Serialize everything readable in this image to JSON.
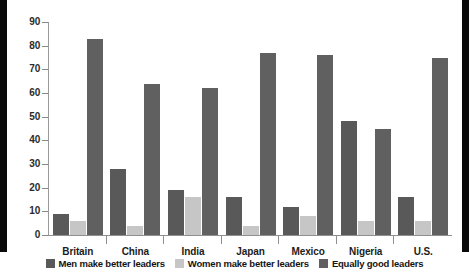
{
  "chart_data": {
    "type": "bar",
    "title": "",
    "subtitle": "",
    "xlabel": "",
    "ylabel": "",
    "ylim": [
      0,
      90
    ],
    "yticks": [
      0,
      10,
      20,
      30,
      40,
      50,
      60,
      70,
      80,
      90
    ],
    "grid": false,
    "legend_position": "bottom",
    "categories": [
      "Britain",
      "China",
      "India",
      "Japan",
      "Mexico",
      "Nigeria",
      "U.S."
    ],
    "series": [
      {
        "name": "Men make better leaders",
        "color": "#595959",
        "values": [
          9,
          28,
          19,
          16,
          12,
          48,
          16
        ]
      },
      {
        "name": "Women make better leaders",
        "color": "#c6c6c6",
        "values": [
          6,
          4,
          16,
          4,
          8,
          6,
          6
        ]
      },
      {
        "name": "Equally good leaders",
        "color": "#606060",
        "values": [
          83,
          64,
          62,
          77,
          76,
          45,
          75
        ]
      }
    ]
  },
  "legend": {
    "items": [
      {
        "label": "Men make better leaders",
        "swatch": "men-swatch"
      },
      {
        "label": "Women make better leaders",
        "swatch": "women-swatch"
      },
      {
        "label": "Equally good leaders",
        "swatch": "equal-swatch"
      }
    ]
  }
}
